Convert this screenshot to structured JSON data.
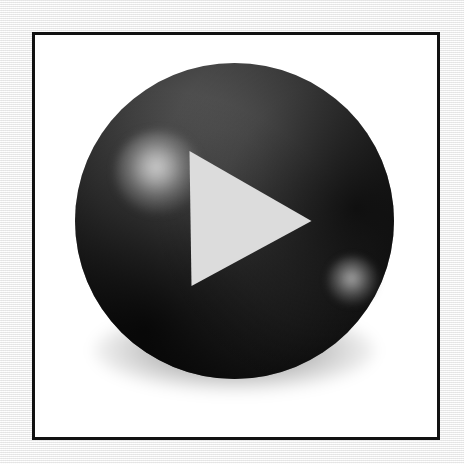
{
  "image": {
    "title": "Play Button Icon",
    "subject": "glossy black sphere play button",
    "width": 464,
    "height": 464,
    "background_color": "#f1f1f1"
  },
  "frame": {
    "name": "picture-frame",
    "border_color": "#111111",
    "border_width": 3,
    "fill_color": "#ffffff",
    "x": 32,
    "y": 32,
    "width": 408,
    "height": 408
  },
  "sphere": {
    "name": "glossy-sphere",
    "center_x": 235,
    "center_y": 222,
    "diameter": 319,
    "base_color": "#000000",
    "lit_color": "#626262",
    "rim_color": "#000000",
    "shadow_color": "rgba(0,0,0,0.42)"
  },
  "highlights": [
    {
      "name": "highlight-primary",
      "center_x": 153,
      "center_y": 168,
      "radius": 43,
      "peak_color": "#d2d2d2"
    },
    {
      "name": "highlight-secondary",
      "center_x": 327,
      "center_y": 280,
      "radius": 25,
      "peak_color": "#b2b2b2"
    }
  ],
  "play_icon": {
    "name": "play-triangle",
    "fill_color": "#dcdcdc",
    "points": "190,152 312,222 192,287",
    "vertices": [
      {
        "x": 190,
        "y": 152
      },
      {
        "x": 312,
        "y": 222
      },
      {
        "x": 192,
        "y": 287
      }
    ]
  }
}
